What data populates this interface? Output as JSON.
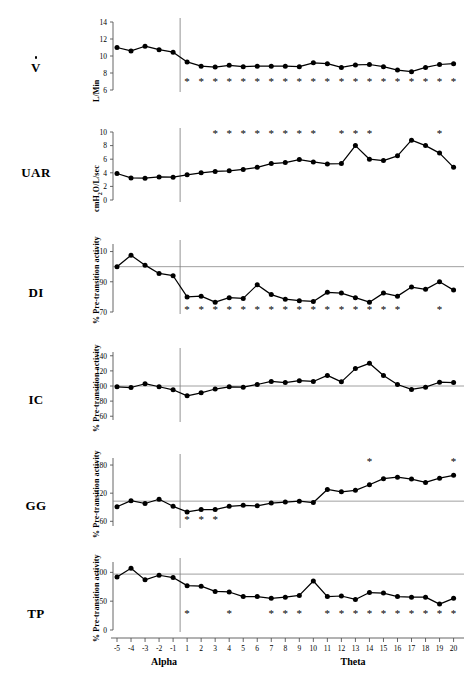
{
  "figure": {
    "title": "",
    "panels_count": 6,
    "x_axis": {
      "label_left": "Alpha",
      "label_right": "Theta",
      "ticks": [
        "-5",
        "-4",
        "-3",
        "-2",
        "-1",
        "1",
        "2",
        "3",
        "4",
        "5",
        "6",
        "7",
        "8",
        "9",
        "10",
        "11",
        "12",
        "13",
        "14",
        "15",
        "16",
        "17",
        "18",
        "19",
        "20"
      ]
    }
  },
  "chart_data": [
    {
      "type": "line",
      "name": "V-dot",
      "row_label": "V",
      "row_label_has_overdot": true,
      "title": "",
      "xlabel": "",
      "ylabel": "L/Min",
      "x": [
        -5,
        -4,
        -3,
        -2,
        -1,
        1,
        2,
        3,
        4,
        5,
        6,
        7,
        8,
        9,
        10,
        11,
        12,
        13,
        14,
        15,
        16,
        17,
        18,
        19,
        20
      ],
      "values": [
        11.0,
        10.6,
        11.15,
        10.75,
        10.45,
        9.3,
        8.8,
        8.7,
        8.9,
        8.75,
        8.8,
        8.8,
        8.8,
        8.75,
        9.2,
        9.1,
        8.65,
        8.95,
        9.0,
        8.75,
        8.35,
        8.15,
        8.65,
        9.0,
        9.1
      ],
      "ylim": [
        6,
        14
      ],
      "yticks": [
        6,
        8,
        10,
        12,
        14
      ],
      "ytick_labels": [
        "6",
        "8",
        "10",
        "12",
        "14"
      ],
      "reference_line": null,
      "significance_marker": "*",
      "significance_y": 7.0,
      "significance_x": [
        1,
        2,
        3,
        4,
        5,
        6,
        7,
        8,
        9,
        10,
        11,
        12,
        13,
        14,
        15,
        16,
        17,
        18,
        19,
        20
      ],
      "grid": false
    },
    {
      "type": "line",
      "name": "UAR",
      "row_label": "UAR",
      "row_label_has_overdot": false,
      "title": "",
      "xlabel": "",
      "ylabel": "cmH2O/L/sec",
      "ylabel_html": "cmH<sub>2</sub>O/L/sec",
      "x": [
        -5,
        -4,
        -3,
        -2,
        -1,
        1,
        2,
        3,
        4,
        5,
        6,
        7,
        8,
        9,
        10,
        11,
        12,
        13,
        14,
        15,
        16,
        17,
        18,
        19,
        20
      ],
      "values": [
        3.9,
        3.25,
        3.2,
        3.4,
        3.35,
        3.7,
        4.0,
        4.2,
        4.3,
        4.5,
        4.8,
        5.35,
        5.5,
        5.95,
        5.6,
        5.3,
        5.35,
        8.0,
        6.0,
        5.8,
        6.5,
        8.8,
        8.0,
        6.9,
        4.8
      ],
      "ylim": [
        0,
        10
      ],
      "yticks": [
        0,
        2,
        4,
        6,
        8,
        10
      ],
      "ytick_labels": [
        "0",
        "2",
        "4",
        "6",
        "8",
        "10"
      ],
      "reference_line": null,
      "significance_marker": "*",
      "significance_y": 9.7,
      "significance_x": [
        3,
        4,
        5,
        6,
        7,
        8,
        9,
        10,
        12,
        13,
        14,
        19
      ],
      "grid": false
    },
    {
      "type": "line",
      "name": "DI",
      "row_label": "DI",
      "row_label_has_overdot": false,
      "title": "",
      "xlabel": "",
      "ylabel": "% Pre-transition activity",
      "x": [
        -5,
        -4,
        -3,
        -2,
        -1,
        1,
        2,
        3,
        4,
        5,
        6,
        7,
        8,
        9,
        10,
        11,
        12,
        13,
        14,
        15,
        16,
        17,
        18,
        19,
        20
      ],
      "values": [
        100,
        107.5,
        101,
        95.5,
        94,
        80,
        80.5,
        76.5,
        79.5,
        79,
        88,
        81.5,
        78.5,
        77.5,
        77,
        83,
        82.5,
        79.5,
        76.5,
        82.5,
        80.5,
        86.5,
        85,
        90,
        84.5
      ],
      "last_value": 90.5,
      "ylim": [
        70,
        115
      ],
      "yticks": [
        70,
        90,
        110
      ],
      "ytick_labels": [
        "70",
        "90",
        "110"
      ],
      "reference_line": 100,
      "significance_marker": "*",
      "significance_y": 71.5,
      "significance_x": [
        1,
        2,
        3,
        4,
        5,
        6,
        7,
        8,
        9,
        10,
        11,
        12,
        13,
        14,
        15,
        16,
        19
      ],
      "grid": false
    },
    {
      "type": "line",
      "name": "IC",
      "row_label": "IC",
      "row_label_has_overdot": false,
      "title": "",
      "xlabel": "",
      "ylabel": "% Pre-transition activity",
      "x": [
        -5,
        -4,
        -3,
        -2,
        -1,
        1,
        2,
        3,
        4,
        5,
        6,
        7,
        8,
        9,
        10,
        11,
        12,
        13,
        14,
        15,
        16,
        17,
        18,
        19,
        20
      ],
      "values": [
        99,
        98,
        103,
        99,
        95,
        87,
        91,
        96,
        99,
        98.5,
        102,
        106,
        104.5,
        107,
        106,
        114,
        105.5,
        123,
        130,
        114,
        102,
        95.5,
        98.5,
        105,
        104.5
      ],
      "ylim": [
        55,
        145
      ],
      "yticks": [
        60,
        80,
        100,
        120,
        140
      ],
      "ytick_labels": [
        "60",
        "80",
        "100",
        "120",
        "140"
      ],
      "reference_line": 100,
      "significance_marker": "*",
      "significance_y": null,
      "significance_x": [],
      "grid": false
    },
    {
      "type": "line",
      "name": "GG",
      "row_label": "GG",
      "row_label_has_overdot": false,
      "title": "",
      "xlabel": "",
      "ylabel": "% Pre-transition activity",
      "x": [
        -5,
        -4,
        -3,
        -2,
        -1,
        1,
        2,
        3,
        4,
        5,
        6,
        7,
        8,
        9,
        10,
        11,
        12,
        13,
        14,
        15,
        16,
        17,
        18,
        19,
        20
      ],
      "values": [
        91,
        104,
        98,
        107,
        92,
        80,
        85,
        85,
        92,
        94,
        93,
        99,
        101,
        103,
        100,
        128,
        123,
        126,
        138,
        151,
        154,
        150,
        143,
        152,
        158
      ],
      "extra_values": [
        162,
        181
      ],
      "ylim": [
        50,
        195
      ],
      "yticks": [
        60,
        120,
        180
      ],
      "ytick_labels": [
        "60",
        "120",
        "180"
      ],
      "reference_line": 103,
      "significance_marker": "*",
      "significance_y_below": 62,
      "significance_x_below": [
        1,
        2,
        3
      ],
      "significance_y_above": 186,
      "significance_x_above": [
        14,
        20
      ],
      "grid": false
    },
    {
      "type": "line",
      "name": "TP",
      "row_label": "TP",
      "row_label_has_overdot": false,
      "title": "",
      "xlabel": "",
      "ylabel": "% Pre-transition activity",
      "x": [
        -5,
        -4,
        -3,
        -2,
        -1,
        1,
        2,
        3,
        4,
        5,
        6,
        7,
        8,
        9,
        10,
        11,
        12,
        13,
        14,
        15,
        16,
        17,
        18,
        19,
        20
      ],
      "values": [
        92,
        107,
        87,
        95,
        91,
        77,
        76,
        67,
        66,
        58,
        58,
        55,
        57,
        60,
        85,
        58,
        59,
        53,
        65,
        64,
        58,
        57,
        57,
        45,
        55
      ],
      "ylim": [
        0,
        118
      ],
      "yticks": [
        0,
        50,
        100
      ],
      "ytick_labels": [
        "0",
        "50",
        "100"
      ],
      "reference_line": 97,
      "significance_marker": "*",
      "significance_y": 27,
      "significance_x": [
        1,
        4,
        7,
        8,
        9,
        11,
        12,
        13,
        14,
        15,
        16,
        17,
        18,
        19,
        20
      ],
      "grid": false
    }
  ],
  "style": {
    "line_color": "#000000",
    "marker_color": "#000000",
    "reference_line_color": "#888888",
    "axis_color": "#555555",
    "background": "#ffffff"
  }
}
